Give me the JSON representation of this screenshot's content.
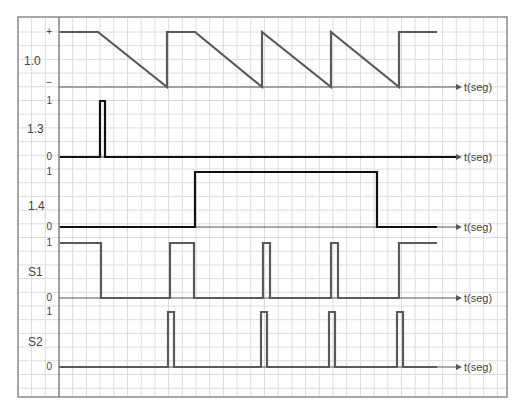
{
  "frame": {
    "left": 18,
    "top": 17,
    "right": 507,
    "bottom": 397,
    "axis_x": 59,
    "grid_step": 13.7
  },
  "colors": {
    "grid": "#dcdcdc",
    "frame": "#8a8a8a",
    "axis": "#555555",
    "trace_gray": "#5a5a5a",
    "trace_black": "#111111",
    "text": "#444444"
  },
  "x_axis_label": "t(seg)",
  "chart_data": {
    "type": "line",
    "title": "",
    "xlabel": "t(seg)",
    "panels": [
      {
        "name": "1.0",
        "y_ticks": [
          "+",
          "−"
        ],
        "y_top": 32,
        "y_base": 87,
        "color": "#5a5a5a",
        "points": [
          [
            60,
            32
          ],
          [
            98,
            32
          ],
          [
            167,
            87
          ],
          [
            167,
            32
          ],
          [
            195,
            32
          ],
          [
            262,
            87
          ],
          [
            262,
            32
          ],
          [
            331,
            87
          ],
          [
            331,
            32
          ],
          [
            399,
            87
          ],
          [
            399,
            32
          ],
          [
            437,
            32
          ]
        ],
        "arrow_end": 458
      },
      {
        "name": "1.3",
        "y_ticks": [
          "1",
          "0"
        ],
        "y_top": 101,
        "y_base": 157,
        "color": "#111111",
        "points": [
          [
            60,
            157
          ],
          [
            100,
            157
          ],
          [
            100,
            101
          ],
          [
            105,
            101
          ],
          [
            105,
            157
          ],
          [
            456,
            157
          ]
        ],
        "arrow_end": 458
      },
      {
        "name": "1.4",
        "y_ticks": [
          "1",
          "0"
        ],
        "y_top": 172,
        "y_base": 227,
        "color": "#111111",
        "points": [
          [
            60,
            227
          ],
          [
            195,
            227
          ],
          [
            195,
            172
          ],
          [
            377,
            172
          ],
          [
            377,
            227
          ],
          [
            437,
            227
          ]
        ],
        "arrow_end": 458
      },
      {
        "name": "S1",
        "y_ticks": [
          "1",
          "0"
        ],
        "y_top": 243,
        "y_base": 298,
        "color": "#5a5a5a",
        "points": [
          [
            60,
            243
          ],
          [
            101,
            243
          ],
          [
            101,
            298
          ],
          [
            170,
            298
          ],
          [
            170,
            243
          ],
          [
            194,
            243
          ],
          [
            194,
            298
          ],
          [
            263,
            298
          ],
          [
            263,
            243
          ],
          [
            270,
            243
          ],
          [
            270,
            298
          ],
          [
            331,
            298
          ],
          [
            331,
            243
          ],
          [
            338,
            243
          ],
          [
            338,
            298
          ],
          [
            399,
            298
          ],
          [
            399,
            243
          ],
          [
            437,
            243
          ]
        ],
        "arrow_end": 458
      },
      {
        "name": "S2",
        "y_ticks": [
          "1",
          "0"
        ],
        "y_top": 312,
        "y_base": 367,
        "color": "#5a5a5a",
        "points": [
          [
            60,
            367
          ],
          [
            168,
            367
          ],
          [
            168,
            312
          ],
          [
            174,
            312
          ],
          [
            174,
            367
          ],
          [
            261,
            367
          ],
          [
            261,
            312
          ],
          [
            267,
            312
          ],
          [
            267,
            367
          ],
          [
            329,
            367
          ],
          [
            329,
            312
          ],
          [
            335,
            312
          ],
          [
            335,
            367
          ],
          [
            397,
            367
          ],
          [
            397,
            312
          ],
          [
            403,
            312
          ],
          [
            403,
            367
          ],
          [
            437,
            367
          ]
        ],
        "arrow_end": 458
      }
    ]
  }
}
